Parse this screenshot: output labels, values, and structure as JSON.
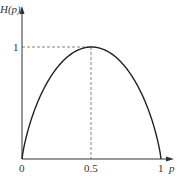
{
  "chart_data": {
    "type": "line",
    "title": "",
    "xlabel": "p",
    "ylabel": "H(p)",
    "x_ticks": [
      "0",
      "0.5",
      "1"
    ],
    "y_ticks": [
      "1"
    ],
    "xlim": [
      0,
      1
    ],
    "ylim": [
      0,
      1
    ],
    "grid": false,
    "series": [
      {
        "name": "H(p)",
        "x": [
          0,
          0.05,
          0.1,
          0.2,
          0.3,
          0.4,
          0.5,
          0.6,
          0.7,
          0.8,
          0.9,
          0.95,
          1
        ],
        "y": [
          0,
          0.286,
          0.469,
          0.722,
          0.881,
          0.971,
          1.0,
          0.971,
          0.881,
          0.722,
          0.469,
          0.286,
          0
        ]
      }
    ],
    "annotations": [
      {
        "type": "dashed-guide",
        "description": "horizontal dashed line from y-axis at H=1 to peak"
      },
      {
        "type": "dashed-guide",
        "description": "vertical dashed line from peak down to p=0.5"
      }
    ]
  },
  "labels": {
    "ylabel": "H(p)",
    "xlabel": "p",
    "x0": "0",
    "x05": "0.5",
    "x1": "1",
    "y1": "1"
  }
}
